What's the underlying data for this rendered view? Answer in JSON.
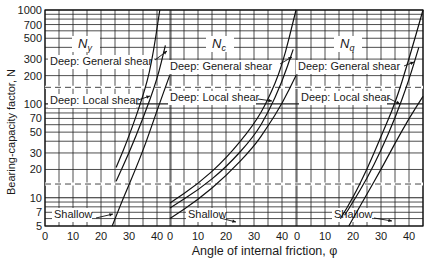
{
  "chart_data": {
    "type": "line",
    "title": "",
    "xlabel": "Angle of internal friction, φ",
    "ylabel": "Bearing-capacity factor, N",
    "yscale": "log",
    "ylim": [
      5,
      1000
    ],
    "ytick_labels": [
      "5",
      "7",
      "10",
      "20",
      "30",
      "50",
      "70",
      "100",
      "200",
      "300",
      "500",
      "700",
      "1000"
    ],
    "ytick_values": [
      5,
      7,
      10,
      20,
      30,
      50,
      70,
      100,
      200,
      300,
      500,
      700,
      1000
    ],
    "grid": true,
    "dashed_reference_lines": [
      14,
      150
    ],
    "panels": [
      {
        "factor": "Nγ",
        "factor_base": "N",
        "factor_sub": "γ",
        "xlim": [
          0,
          45
        ],
        "xtick_labels": [
          "0",
          "10",
          "20",
          "30",
          "40"
        ],
        "xtick_values": [
          0,
          10,
          20,
          30,
          40
        ],
        "series": [
          {
            "name": "Deep: General shear",
            "x": [
              25.4,
              30,
              35,
              38,
              41
            ],
            "y": [
              21,
              45,
              120,
              260,
              1000
            ]
          },
          {
            "name": "Deep: Local shear",
            "x": [
              25.4,
              30,
              35,
              40,
              43
            ],
            "y": [
              15,
              30,
              70,
              180,
              420
            ]
          },
          {
            "name": "Shallow",
            "x": [
              24,
              28,
              32,
              36,
              40,
              44.5
            ],
            "y": [
              5,
              10,
              19,
              38,
              85,
              200
            ]
          }
        ],
        "annotations": [
          "Deep: General shear",
          "Deep: Local shear",
          "Shallow"
        ]
      },
      {
        "factor": "Nc",
        "factor_base": "N",
        "factor_sub": "c",
        "xlim": [
          0,
          45
        ],
        "xtick_labels": [
          "0",
          "10",
          "20",
          "30",
          "40"
        ],
        "xtick_values": [
          0,
          10,
          20,
          30,
          40
        ],
        "series": [
          {
            "name": "Deep: General shear",
            "x": [
              0,
              10,
              20,
              30,
              35,
              40,
              45
            ],
            "y": [
              8.8,
              14,
              26,
              60,
              110,
              250,
              1000
            ]
          },
          {
            "name": "Deep: Local shear",
            "x": [
              0,
              10,
              20,
              30,
              35,
              40,
              44
            ],
            "y": [
              7.8,
              12,
              21,
              45,
              80,
              170,
              380
            ]
          },
          {
            "name": "Shallow",
            "x": [
              0,
              10,
              20,
              30,
              35,
              40,
              45
            ],
            "y": [
              6,
              9.5,
              17,
              35,
              58,
              100,
              200
            ]
          }
        ],
        "annotations": [
          "Deep: General shear",
          "Deep: Local shear",
          "Shallow"
        ]
      },
      {
        "factor": "Nq",
        "factor_base": "N",
        "factor_sub": "q",
        "xlim": [
          0,
          45
        ],
        "xtick_labels": [
          "0",
          "10",
          "20",
          "30",
          "40"
        ],
        "xtick_values": [
          0,
          10,
          20,
          30,
          40
        ],
        "series": [
          {
            "name": "Deep: General shear",
            "x": [
              15.5,
              20,
              25,
              30,
              35,
              40,
              45
            ],
            "y": [
              6,
              10,
              20,
              45,
              100,
              300,
              1000
            ]
          },
          {
            "name": "Deep: Local shear",
            "x": [
              17,
              20,
              25,
              30,
              35,
              40,
              43.5
            ],
            "y": [
              6.5,
              9,
              16,
              32,
              70,
              180,
              400
            ]
          },
          {
            "name": "Shallow",
            "x": [
              18.5,
              20,
              25,
              30,
              35,
              40,
              45
            ],
            "y": [
              5,
              6,
              11,
              20,
              38,
              70,
              120
            ]
          }
        ],
        "annotations": [
          "Deep: General shear",
          "Deep: Local shear",
          "Shallow"
        ]
      }
    ]
  },
  "labels": {
    "deep_general": "Deep: General shear",
    "deep_local": "Deep: Local shear",
    "shallow": "Shallow"
  }
}
